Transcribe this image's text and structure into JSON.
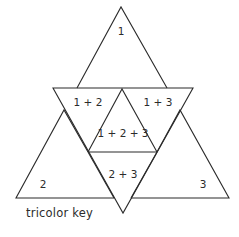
{
  "diagram": {
    "title": "tricolor key",
    "regions": [
      {
        "id": "r1",
        "label": "1"
      },
      {
        "id": "r12",
        "label": "1 + 2"
      },
      {
        "id": "r13",
        "label": "1 + 3"
      },
      {
        "id": "r123",
        "label": "1 + 2 + 3"
      },
      {
        "id": "r23",
        "label": "2 + 3"
      },
      {
        "id": "r2",
        "label": "2"
      },
      {
        "id": "r3",
        "label": "3"
      }
    ],
    "colors": {
      "line": "#2b2b2b",
      "background": "#ffffff"
    }
  }
}
